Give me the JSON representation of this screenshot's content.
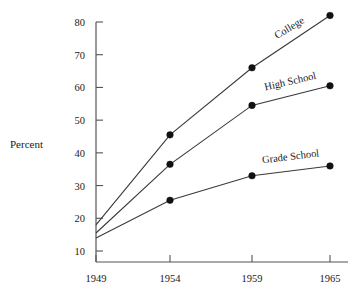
{
  "chart_data": {
    "type": "line",
    "title": "",
    "xlabel": "",
    "ylabel": "Percent",
    "x": [
      1949,
      1954,
      1959,
      1965
    ],
    "categories": [
      "1949",
      "1954",
      "1959",
      "1965"
    ],
    "xtick_labels": [
      "1949",
      "1954",
      "1959",
      "1965"
    ],
    "ytick_labels": [
      "10",
      "20",
      "30",
      "40",
      "50",
      "60",
      "70",
      "80"
    ],
    "yticks": [
      10,
      20,
      30,
      40,
      50,
      60,
      70,
      80
    ],
    "ylim": [
      8,
      84
    ],
    "xlim": [
      1949,
      1967
    ],
    "grid": false,
    "legend": "inline-labels",
    "series": [
      {
        "name": "College",
        "label": "College",
        "values": [
          18,
          45.5,
          66,
          82
        ],
        "markers": [
          false,
          true,
          true,
          true
        ],
        "label_angle": -31
      },
      {
        "name": "High School",
        "label": "High School",
        "values": [
          15.5,
          36.5,
          54.5,
          60.5
        ],
        "markers": [
          false,
          true,
          true,
          true
        ],
        "label_angle": -13
      },
      {
        "name": "Grade School",
        "label": "Grade School",
        "values": [
          14,
          25.5,
          33,
          36
        ],
        "markers": [
          false,
          true,
          true,
          true
        ],
        "label_angle": -7
      }
    ],
    "colors": {
      "line": "#3a3a3a",
      "marker": "#111111",
      "axis": "#555555",
      "text": "#1a1a1a",
      "background": "#ffffff"
    }
  },
  "axis": {
    "y_title": "Percent"
  }
}
